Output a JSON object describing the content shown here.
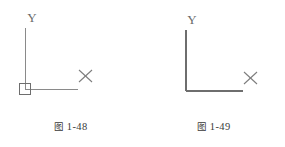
{
  "page": {
    "background_color": "#ffffff",
    "width": 285,
    "height": 147
  },
  "figures": [
    {
      "id": "figure-1-48",
      "caption_cjk": "图",
      "caption_number": "1-48",
      "caption_full": "图 1-48",
      "description": "UCS icon with square origin marker",
      "has_origin_square": true,
      "line_color": "#8a8a8a",
      "line_width": 1,
      "labels": {
        "y_axis": "Y",
        "x_axis": "X"
      },
      "geometry": {
        "origin_x": 25,
        "origin_y": 89,
        "y_axis_top": 28,
        "x_axis_end": 78,
        "square_x": 19,
        "square_y": 83,
        "square_size": 11,
        "y_label_x": 32,
        "y_label_y": 22,
        "x_label_x": 85,
        "x_label_y": 79
      }
    },
    {
      "id": "figure-1-49",
      "caption_cjk": "图",
      "caption_number": "1-49",
      "caption_full": "图 1-49",
      "description": "UCS icon without origin marker",
      "has_origin_square": false,
      "line_color": "#6e6e6e",
      "line_width": 2,
      "labels": {
        "y_axis": "Y",
        "x_axis": "X"
      },
      "geometry": {
        "origin_x": 43,
        "origin_y": 91,
        "y_axis_top": 30,
        "x_axis_end": 100,
        "y_label_x": 49,
        "y_label_y": 24,
        "x_label_x": 107,
        "x_label_y": 81
      }
    }
  ],
  "colors": {
    "line_light": "#8a8a8a",
    "line_dark": "#6e6e6e",
    "label_text": "#6b6b6b",
    "caption_text": "#3a3a3a",
    "background": "#ffffff"
  }
}
